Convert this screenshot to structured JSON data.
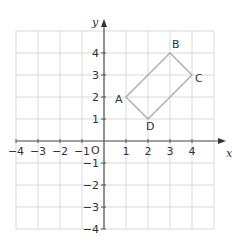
{
  "chart_data": {
    "type": "scatter",
    "title": "",
    "xlabel": "x",
    "ylabel": "y",
    "xlim": [
      -4,
      5
    ],
    "ylim": [
      -4,
      5
    ],
    "grid": true,
    "origin_label": "O",
    "x_ticks": [
      -4,
      -3,
      -2,
      -1,
      1,
      2,
      3,
      4
    ],
    "x_tick_labels": [
      "−4",
      "−3",
      "−2",
      "−1",
      "1",
      "2",
      "3",
      "4"
    ],
    "y_ticks": [
      -4,
      -3,
      -2,
      -1,
      1,
      2,
      3,
      4
    ],
    "y_tick_labels": [
      "−4",
      "−3",
      "−2",
      "−1",
      "1",
      "2",
      "3",
      "4"
    ],
    "polygon": {
      "name": "ABCD",
      "closed": true,
      "color": "#a8a8a8",
      "points": [
        {
          "label": "A",
          "x": 1,
          "y": 2
        },
        {
          "label": "B",
          "x": 3,
          "y": 4
        },
        {
          "label": "C",
          "x": 4,
          "y": 3
        },
        {
          "label": "D",
          "x": 2,
          "y": 1
        }
      ]
    }
  }
}
